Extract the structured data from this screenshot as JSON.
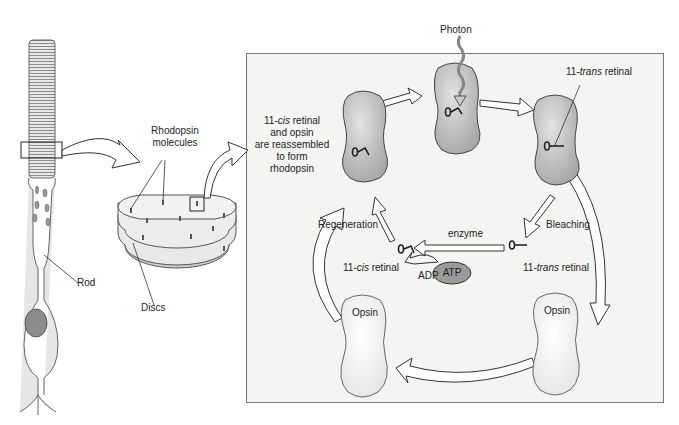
{
  "figure": {
    "left_labels": {
      "rod": "Rod",
      "rhodopsin_line1": "Rhodopsin",
      "rhodopsin_line2": "molecules",
      "discs": "Discs"
    },
    "cycle": {
      "photon": "Photon",
      "trans_retinal_top_prefix": "11-",
      "trans_retinal_top_italic": "trans",
      "trans_retinal_top_suffix": " retinal",
      "reassembled_line1_prefix": "11-",
      "reassembled_line1_italic": "cis",
      "reassembled_line1_suffix": " retinal",
      "reassembled_line2": "and opsin",
      "reassembled_line3": "are reassembled",
      "reassembled_line4": "to form",
      "reassembled_line5": "rhodopsin",
      "regeneration": "Regeneration",
      "bleaching": "Bleaching",
      "enzyme": "enzyme",
      "cis_retinal_prefix": "11-",
      "cis_retinal_italic": "cis",
      "cis_retinal_suffix": " retinal",
      "trans_retinal_prefix": "11-",
      "trans_retinal_italic": "trans",
      "trans_retinal_suffix": " retinal",
      "adp": "ADP",
      "atp": "ATP",
      "opsin_left": "Opsin",
      "opsin_right": "Opsin"
    },
    "colors": {
      "panel_bg": "#f4f4f3",
      "protein_fill": "#bdbdbd",
      "atp_fill": "#9a9a9a",
      "outline": "#333333"
    }
  }
}
